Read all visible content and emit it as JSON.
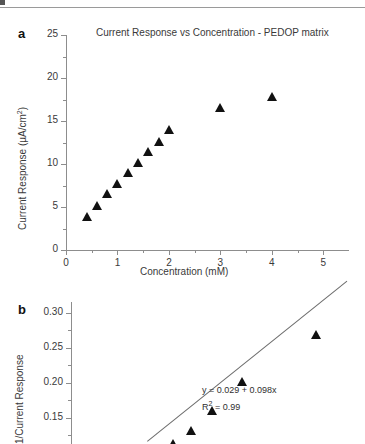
{
  "figure": {
    "panel_a_label": "a",
    "panel_b_label": "b"
  },
  "chart_data": [
    {
      "type": "scatter",
      "panel": "a",
      "title": "Current Response vs Concentration - PEDOP matrix",
      "xlabel": "Concentration (mM)",
      "ylabel": "Current Response (µA/cm²)",
      "ylabel_base": "Current Response (µA/cm",
      "ylabel_sup": "2",
      "ylabel_tail": ")",
      "xlim": [
        0,
        5.5
      ],
      "ylim": [
        0,
        25
      ],
      "xticks": [
        0,
        1,
        2,
        3,
        4,
        5
      ],
      "xticklabels": [
        "0",
        "1",
        "2",
        "3",
        "4",
        "5"
      ],
      "yticks": [
        0,
        5,
        10,
        15,
        20,
        25
      ],
      "yticklabels": [
        "0",
        "5",
        "10",
        "15",
        "20",
        "25"
      ],
      "minor_ticks": true,
      "grid": false,
      "legend": "none",
      "marker": "filled-triangle",
      "marker_color": "#111111",
      "x": [
        0.4,
        0.6,
        0.8,
        1.0,
        1.2,
        1.4,
        1.6,
        1.8,
        2.0,
        3.0,
        4.0
      ],
      "y": [
        3.8,
        5.1,
        6.5,
        7.7,
        8.9,
        10.1,
        11.4,
        12.6,
        14.0,
        16.5,
        17.8
      ]
    },
    {
      "type": "scatter",
      "panel": "b",
      "title": "",
      "xlabel": "",
      "ylabel": "1/Current Response",
      "ylim": [
        0.1,
        0.315
      ],
      "xlim": [
        0,
        2.5
      ],
      "yticks": [
        0.1,
        0.15,
        0.2,
        0.25,
        0.3
      ],
      "yticklabels": [
        "0.10",
        "0.15",
        "0.20",
        "0.25",
        "0.30"
      ],
      "minor_ticks": true,
      "grid": false,
      "legend": "none",
      "marker": "filled-triangle",
      "marker_color": "#111111",
      "fit_line": true,
      "annotation_equation": "y = 0.029 + 0.098x",
      "annotation_r2_base": "R",
      "annotation_r2_sup": "2",
      "annotation_r2_tail": " = 0.99",
      "x": [
        0.5,
        0.62,
        0.72,
        0.83,
        1.0,
        1.25,
        1.67,
        2.5
      ],
      "y": [
        0.103,
        0.113,
        0.131,
        0.16,
        0.201,
        0.268,
        0.105,
        0.118
      ]
    }
  ]
}
